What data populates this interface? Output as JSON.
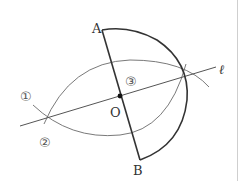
{
  "figure": {
    "type": "geometric-construction",
    "colors": {
      "thick_stroke": "#333333",
      "thin_stroke": "#666666",
      "label": "#333333"
    },
    "points": {
      "A": {
        "label": "A"
      },
      "B": {
        "label": "B"
      },
      "O": {
        "label": "O"
      }
    },
    "line_label": "ℓ",
    "step_labels": [
      "①",
      "②",
      "③"
    ]
  }
}
